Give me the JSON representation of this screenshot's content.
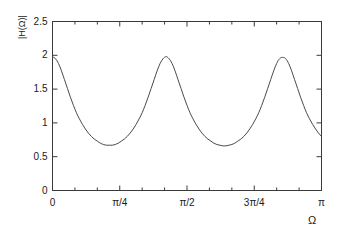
{
  "chart_data": {
    "type": "line",
    "title": "",
    "subtitle": "",
    "xlabel": "Ω",
    "ylabel": "|H(Ω)|",
    "xlim": [
      0,
      3.14159265358979
    ],
    "ylim": [
      0,
      2.5
    ],
    "grid": false,
    "legend": null,
    "x_tick_labels": [
      "0",
      "π/4",
      "π/2",
      "3π/4",
      "π"
    ],
    "x_tick_values": [
      0,
      0.78539816,
      1.57079633,
      2.35619449,
      3.14159265
    ],
    "y_tick_labels": [
      "0",
      "0.5",
      "1",
      "1.5",
      "2",
      "2.5"
    ],
    "y_tick_values": [
      0,
      0.5,
      1,
      1.5,
      2,
      2.5
    ],
    "x_minor_ticks_per_interval": 2,
    "y_minor_ticks_per_interval": 0,
    "series": [
      {
        "name": "|H(Ω)|",
        "color": "#4a4a4a",
        "line_width": 1,
        "peaks": {
          "x": [
            0,
            0.78539816,
            1.57079633,
            2.35619449,
            3.14159265
          ],
          "y": [
            1.98,
            1.98,
            1.97,
            1.96,
            1.95
          ]
        },
        "valleys": {
          "x": [
            0.39269908,
            1.17809725,
            1.96349541,
            2.74889357
          ],
          "y": [
            0.67,
            0.66,
            0.65,
            0.64
          ]
        },
        "x": [
          0.0,
          0.03490659,
          0.06981317,
          0.10471976,
          0.13962634,
          0.17453293,
          0.20943951,
          0.2443461,
          0.27925268,
          0.31415927,
          0.34906585,
          0.38397244,
          0.41887902,
          0.45378561,
          0.48869219,
          0.52359878,
          0.55850536,
          0.59341195,
          0.62831853,
          0.66322512,
          0.6981317,
          0.73303829,
          0.76794487,
          0.80285146,
          0.83775804,
          0.87266463,
          0.90757121,
          0.9424778,
          0.97738438,
          1.01229097,
          1.04719755,
          1.08210414,
          1.11701072,
          1.15191731,
          1.18682389,
          1.22173048,
          1.25663706,
          1.29154365,
          1.32645023,
          1.36135682,
          1.3962634,
          1.43116999,
          1.46607657,
          1.50098316,
          1.53588974,
          1.57079633,
          1.60570291,
          1.6406095,
          1.67551608,
          1.71042267,
          1.74532925,
          1.78023584,
          1.81514242,
          1.85004901,
          1.88495559,
          1.91986218,
          1.95476876,
          1.98967535,
          2.02458193,
          2.05948852,
          2.0943951,
          2.12930169,
          2.16420827,
          2.19911486,
          2.23402144,
          2.26892803,
          2.30383461,
          2.3387412,
          2.37364778,
          2.40855437,
          2.44346095,
          2.47836754,
          2.51327412,
          2.54818071,
          2.58308729,
          2.61799388,
          2.65290046,
          2.68780705,
          2.72271363,
          2.75762022,
          2.7925268,
          2.82743339,
          2.86233997,
          2.89724656,
          2.93215314,
          2.96705973,
          3.00196631,
          3.0368729,
          3.07177948,
          3.10668607,
          3.14159265
        ],
        "y": [
          1.98,
          1.95,
          1.88,
          1.77,
          1.64,
          1.51,
          1.38,
          1.26,
          1.15,
          1.06,
          0.98,
          0.91,
          0.85,
          0.8,
          0.76,
          0.73,
          0.7,
          0.68,
          0.67,
          0.67,
          0.67,
          0.68,
          0.7,
          0.73,
          0.76,
          0.8,
          0.85,
          0.91,
          0.98,
          1.06,
          1.15,
          1.26,
          1.38,
          1.51,
          1.64,
          1.77,
          1.88,
          1.95,
          1.98,
          1.95,
          1.88,
          1.77,
          1.64,
          1.51,
          1.38,
          1.26,
          1.15,
          1.06,
          0.98,
          0.91,
          0.85,
          0.8,
          0.76,
          0.73,
          0.7,
          0.68,
          0.67,
          0.66,
          0.66,
          0.67,
          0.68,
          0.7,
          0.73,
          0.76,
          0.8,
          0.85,
          0.91,
          0.98,
          1.06,
          1.15,
          1.26,
          1.38,
          1.51,
          1.64,
          1.77,
          1.88,
          1.95,
          1.97,
          1.95,
          1.88,
          1.77,
          1.64,
          1.51,
          1.38,
          1.26,
          1.15,
          1.06,
          0.98,
          0.91,
          0.85,
          0.8
        ],
        "description": "Periodic comb-like magnitude response with 4 full lobes between 0 and pi"
      }
    ]
  },
  "figure": {
    "background_color": "#ffffff",
    "frame_color": "#3a3a3a",
    "curve_color": "#4a4a4a"
  }
}
